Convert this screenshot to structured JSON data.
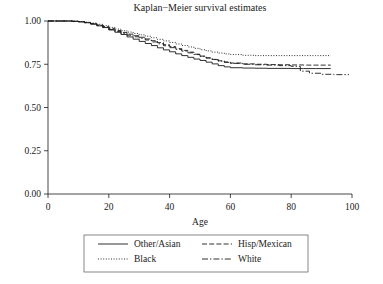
{
  "chart_data": {
    "type": "line",
    "title": "Kaplan−Meier survival estimates",
    "xlabel": "Age",
    "ylabel": "",
    "xlim": [
      0,
      100
    ],
    "ylim": [
      0,
      1.0
    ],
    "grid": false,
    "legend_position": "bottom",
    "xticks": [
      "0",
      "20",
      "40",
      "60",
      "80",
      "100"
    ],
    "xtick_values": [
      0,
      20,
      40,
      60,
      80,
      100
    ],
    "yticks": [
      "0.00",
      "0.25",
      "0.50",
      "0.75",
      "1.00"
    ],
    "ytick_values": [
      0,
      0.25,
      0.5,
      0.75,
      1.0
    ],
    "series": [
      {
        "name": "Other/Asian",
        "style": "solid",
        "x": [
          0,
          5,
          8,
          10,
          12,
          14,
          16,
          18,
          20,
          22,
          24,
          26,
          28,
          30,
          32,
          34,
          36,
          38,
          40,
          42,
          44,
          46,
          48,
          50,
          52,
          54,
          56,
          58,
          60,
          64,
          68,
          72,
          76,
          80,
          84,
          88,
          93
        ],
        "values": [
          1.0,
          1.0,
          0.998,
          0.995,
          0.99,
          0.982,
          0.972,
          0.962,
          0.948,
          0.935,
          0.922,
          0.908,
          0.895,
          0.882,
          0.87,
          0.858,
          0.845,
          0.833,
          0.822,
          0.81,
          0.8,
          0.79,
          0.78,
          0.772,
          0.762,
          0.752,
          0.742,
          0.735,
          0.73,
          0.728,
          0.727,
          0.726,
          0.726,
          0.725,
          0.725,
          0.725,
          0.725
        ]
      },
      {
        "name": "Hisp/Mexican",
        "style": "dashed",
        "x": [
          0,
          5,
          8,
          10,
          12,
          14,
          16,
          18,
          20,
          22,
          24,
          26,
          28,
          30,
          32,
          34,
          36,
          38,
          40,
          42,
          44,
          46,
          48,
          50,
          52,
          54,
          56,
          58,
          60,
          64,
          68,
          72,
          76,
          80,
          84,
          88,
          93
        ],
        "values": [
          1.0,
          1.0,
          0.999,
          0.996,
          0.992,
          0.985,
          0.977,
          0.968,
          0.957,
          0.945,
          0.934,
          0.924,
          0.915,
          0.906,
          0.896,
          0.886,
          0.875,
          0.863,
          0.852,
          0.84,
          0.83,
          0.82,
          0.808,
          0.797,
          0.787,
          0.778,
          0.77,
          0.763,
          0.757,
          0.752,
          0.75,
          0.748,
          0.747,
          0.746,
          0.745,
          0.745,
          0.745
        ]
      },
      {
        "name": "Black",
        "style": "dotted",
        "x": [
          0,
          5,
          8,
          10,
          12,
          14,
          16,
          18,
          20,
          22,
          24,
          26,
          28,
          30,
          32,
          34,
          36,
          38,
          40,
          42,
          44,
          46,
          48,
          50,
          52,
          54,
          56,
          58,
          60,
          64,
          68,
          72,
          76,
          80,
          84,
          88,
          93
        ],
        "values": [
          1.0,
          1.0,
          0.999,
          0.997,
          0.993,
          0.988,
          0.981,
          0.973,
          0.963,
          0.953,
          0.944,
          0.936,
          0.928,
          0.92,
          0.912,
          0.903,
          0.894,
          0.885,
          0.876,
          0.867,
          0.858,
          0.85,
          0.842,
          0.834,
          0.827,
          0.82,
          0.815,
          0.81,
          0.806,
          0.802,
          0.8,
          0.8,
          0.8,
          0.8,
          0.8,
          0.8,
          0.8
        ]
      },
      {
        "name": "White",
        "style": "dashdot",
        "x": [
          0,
          5,
          8,
          10,
          12,
          14,
          16,
          18,
          20,
          22,
          24,
          26,
          28,
          30,
          32,
          34,
          36,
          38,
          40,
          42,
          44,
          46,
          48,
          50,
          52,
          54,
          56,
          58,
          60,
          64,
          68,
          72,
          76,
          80,
          83,
          86,
          90,
          94,
          99
        ],
        "values": [
          1.0,
          1.0,
          0.998,
          0.995,
          0.99,
          0.983,
          0.974,
          0.963,
          0.951,
          0.939,
          0.928,
          0.918,
          0.909,
          0.9,
          0.89,
          0.879,
          0.868,
          0.857,
          0.846,
          0.836,
          0.826,
          0.816,
          0.806,
          0.796,
          0.786,
          0.777,
          0.768,
          0.761,
          0.755,
          0.75,
          0.747,
          0.745,
          0.742,
          0.738,
          0.71,
          0.698,
          0.692,
          0.69,
          0.69
        ]
      }
    ]
  },
  "legend": {
    "entries": [
      {
        "label": "Other/Asian",
        "style": "solid"
      },
      {
        "label": "Hisp/Mexican",
        "style": "dashed"
      },
      {
        "label": "Black",
        "style": "dotted"
      },
      {
        "label": "White",
        "style": "dashdot"
      }
    ]
  }
}
